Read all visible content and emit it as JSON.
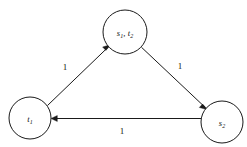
{
  "figure": {
    "type": "directed-graph",
    "background_color": "#ffffff",
    "stroke_color": "#1a1a1a",
    "width": 247,
    "height": 147
  },
  "nodes": [
    {
      "id": "top",
      "name": "node-s1-t2",
      "label_main_1": "s",
      "label_sub_1": "1",
      "label_sep": ", ",
      "label_main_2": "t",
      "label_sub_2": "2",
      "cx": 125,
      "cy": 32,
      "r": 22
    },
    {
      "id": "left",
      "name": "node-t1",
      "label_main_1": "t",
      "label_sub_1": "1",
      "cx": 30,
      "cy": 118,
      "r": 21
    },
    {
      "id": "right",
      "name": "node-s2",
      "label_main_1": "s",
      "label_sub_1": "2",
      "cx": 222,
      "cy": 122,
      "r": 21
    }
  ],
  "edges": [
    {
      "id": "e1",
      "name": "edge-t1-to-s1t2",
      "from": "t1",
      "to": "s1, t2",
      "weight": "1",
      "label_x": 65,
      "label_y": 67
    },
    {
      "id": "e2",
      "name": "edge-s1t2-to-s2",
      "from": "s1, t2",
      "to": "s2",
      "weight": "1",
      "label_x": 180,
      "label_y": 66
    },
    {
      "id": "e3",
      "name": "edge-s2-to-t1",
      "from": "s2",
      "to": "t1",
      "weight": "1",
      "label_x": 122,
      "label_y": 131
    }
  ]
}
